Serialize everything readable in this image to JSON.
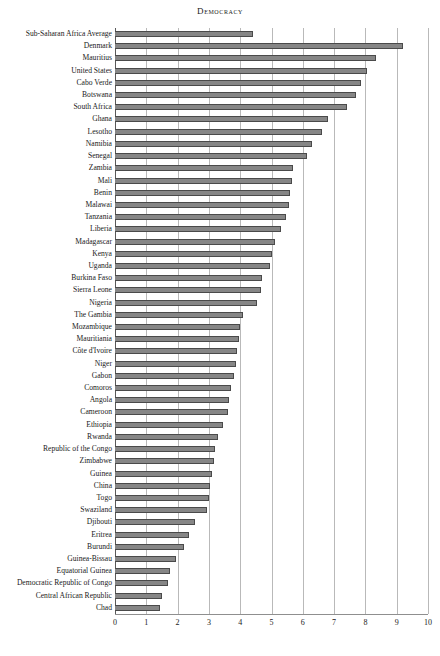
{
  "chart_data": {
    "type": "bar",
    "orientation": "horizontal",
    "title": "Democracy",
    "xlabel": "",
    "ylabel": "",
    "xlim": [
      0,
      10
    ],
    "xticks": [
      0,
      1,
      2,
      3,
      4,
      5,
      6,
      7,
      8,
      9,
      10
    ],
    "grid": true,
    "legend": "none",
    "bar_color": "#868686",
    "bar_edge_color": "#4a4a4a",
    "gridline_color": "#b9b9b9",
    "categories": [
      "Sub-Saharan Africa Average",
      "Denmark",
      "Mauritius",
      "United States",
      "Cabo Verde",
      "Botswana",
      "South Africa",
      "Ghana",
      "Lesotho",
      "Namibia",
      "Senegal",
      "Zambia",
      "Mali",
      "Benin",
      "Malawai",
      "Tanzania",
      "Liberia",
      "Madagascar",
      "Kenya",
      "Uganda",
      "Burkina Faso",
      "Sierra Leone",
      "Nigeria",
      "The Gambia",
      "Mozambique",
      "Mauritiania",
      "Côte d'Ivoire",
      "Niger",
      "Gabon",
      "Comoros",
      "Angola",
      "Cameroon",
      "Ethiopia",
      "Rwanda",
      "Republic of the Congo",
      "Zimbabwe",
      "Guinea",
      "China",
      "Togo",
      "Swaziland",
      "Djibouti",
      "Eritrea",
      "Burundi",
      "Guinea-Bissau",
      "Equatorial Guinea",
      "Democratic Republic of Congo",
      "Central African Republic",
      "Chad"
    ],
    "values": [
      4.4,
      9.2,
      8.35,
      8.05,
      7.85,
      7.7,
      7.4,
      6.8,
      6.6,
      6.3,
      6.15,
      5.7,
      5.65,
      5.6,
      5.55,
      5.45,
      5.3,
      5.1,
      5.0,
      4.95,
      4.7,
      4.65,
      4.55,
      4.1,
      4.0,
      3.95,
      3.9,
      3.85,
      3.8,
      3.7,
      3.65,
      3.6,
      3.45,
      3.3,
      3.2,
      3.15,
      3.1,
      3.05,
      3.0,
      2.95,
      2.55,
      2.35,
      2.2,
      1.95,
      1.75,
      1.7,
      1.5,
      1.45
    ]
  }
}
